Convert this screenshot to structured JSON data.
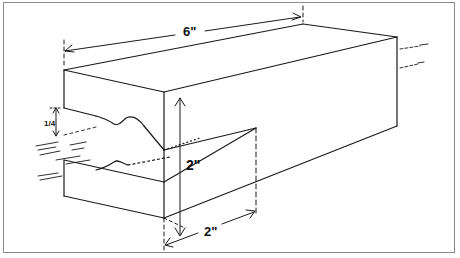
{
  "figure": {
    "type": "isometric technical drawing",
    "colors": {
      "line": "#1a1a1a",
      "border": "#8a8a8a",
      "background": "#ffffff"
    }
  },
  "dimensions": {
    "length": "6\"",
    "height": "2\"",
    "width": "2\"",
    "notch_depth": "1/4"
  }
}
